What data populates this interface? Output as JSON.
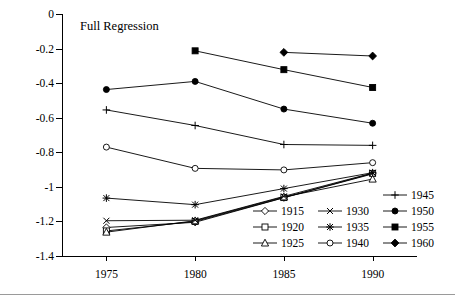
{
  "chart_data": {
    "type": "line",
    "title": "Full Regression",
    "xlabel": "",
    "ylabel": "",
    "x": [
      1975,
      1980,
      1985,
      1990
    ],
    "xticklabels": [
      "1975",
      "1980",
      "1985",
      "1990"
    ],
    "yticklabels": [
      "0",
      "-0.2",
      "-0.4",
      "-0.6",
      "-0.8",
      "-1",
      "-1.2",
      "-1.4"
    ],
    "yticks": [
      0,
      -0.2,
      -0.4,
      -0.6,
      -0.8,
      -1,
      -1.2,
      -1.4
    ],
    "ylim": [
      -1.4,
      0
    ],
    "xlim": [
      1972.5,
      1992.5
    ],
    "grid": false,
    "legend_position": "inside-bottom-right",
    "series": [
      {
        "name": "1915",
        "marker": "open-diamond",
        "values": [
          -1.235,
          -1.205,
          -1.063,
          -0.925
        ]
      },
      {
        "name": "1920",
        "marker": "open-square",
        "values": [
          -1.255,
          -1.2,
          -1.062,
          -0.922
        ]
      },
      {
        "name": "1925",
        "marker": "open-triangle",
        "values": [
          -1.262,
          -1.196,
          -1.058,
          -0.955
        ]
      },
      {
        "name": "1930",
        "marker": "cross",
        "values": [
          -1.196,
          -1.193,
          -1.055,
          -0.92
        ]
      },
      {
        "name": "1935",
        "marker": "asterisk",
        "values": [
          -1.065,
          -1.103,
          -1.01,
          -0.918
        ]
      },
      {
        "name": "1940",
        "marker": "open-circle",
        "values": [
          -0.77,
          -0.893,
          -0.902,
          -0.86
        ]
      },
      {
        "name": "1945",
        "marker": "plus",
        "values": [
          -0.555,
          -0.645,
          -0.755,
          -0.76
        ]
      },
      {
        "name": "1950",
        "marker": "filled-circle",
        "values": [
          -0.437,
          -0.39,
          -0.55,
          -0.632
        ]
      },
      {
        "name": "1955",
        "marker": "filled-square",
        "values": [
          null,
          -0.213,
          -0.322,
          -0.425
        ]
      },
      {
        "name": "1960",
        "marker": "filled-diamond",
        "values": [
          null,
          null,
          -0.222,
          -0.243
        ]
      }
    ]
  },
  "legend": {
    "columns": [
      {
        "entries": [
          "1915",
          "1920",
          "1925"
        ]
      },
      {
        "entries": [
          "1930",
          "1935",
          "1940"
        ]
      },
      {
        "entries": [
          "1945",
          "1950",
          "1955",
          "1960"
        ]
      }
    ]
  },
  "colors": {
    "line": "#000000",
    "axis": "#000000",
    "background": "#ffffff",
    "rule": "#9a9a9a"
  }
}
